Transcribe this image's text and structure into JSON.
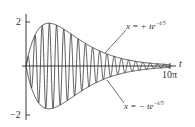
{
  "chart_data": {
    "type": "line",
    "title": "",
    "xlabel": "t",
    "ylabel": "",
    "xlim": [
      0,
      31.416
    ],
    "ylim": [
      -2,
      2
    ],
    "x_tick_labels": [
      "10π"
    ],
    "y_tick_labels": [
      "2",
      "−2"
    ],
    "grid": false,
    "legend": null,
    "series": [
      {
        "name": "x = t e^{-t/5} sin(4t)",
        "function": "t*exp(-t/5)*sin(4t)",
        "style": "oscillating"
      },
      {
        "name": "x = + te^{-t/5}",
        "function": "t*exp(-t/5)",
        "style": "envelope"
      },
      {
        "name": "x = − te^{-t/5}",
        "function": "-t*exp(-t/5)",
        "style": "envelope"
      }
    ],
    "annotations": [
      {
        "text": "x = + te^{-t/5}",
        "points_to": "upper envelope"
      },
      {
        "text": "x = − te^{-t/5}",
        "points_to": "lower envelope"
      }
    ]
  },
  "labels": {
    "y_top": "2",
    "y_bottom": "−2",
    "x_end": "10π",
    "x_axis": "t",
    "upper_prefix": "x = + te",
    "upper_exp": "−t/5",
    "lower_prefix": "x = − te",
    "lower_exp": "−t/5"
  }
}
